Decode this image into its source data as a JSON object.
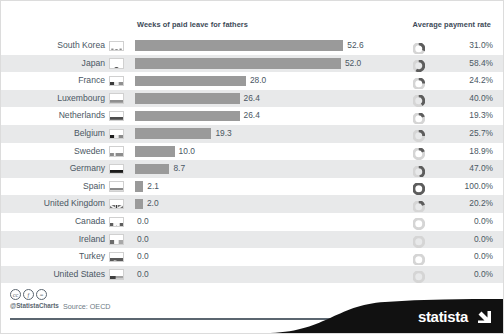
{
  "headers": {
    "left": "Weeks of paid leave for fathers",
    "right": "Average payment rate"
  },
  "footer": {
    "handle": "@StatistaCharts",
    "source": "Source: OECD",
    "brand": "statista",
    "cc_icons": [
      "cc-icon",
      "by-icon",
      "nd-icon"
    ],
    "cc_glyphs": [
      "cc",
      "ƒ",
      "="
    ]
  },
  "colors": {
    "bar": "#9a9a9a",
    "donut_fill": "#5d5d5d",
    "donut_track": "#d5d5d5",
    "row_even": "#e8e9ea",
    "row_odd": "#ffffff",
    "text": "#4a5763",
    "header_text": "#3d4a57",
    "brand_black": "#111111"
  },
  "chart_data": {
    "type": "bar",
    "title": "Weeks of paid leave for fathers",
    "xlabel": "",
    "ylabel": "",
    "xlim": [
      0,
      56
    ],
    "grid": false,
    "legend": "none",
    "categories": [
      "South Korea",
      "Japan",
      "France",
      "Luxembourg",
      "Netherlands",
      "Belgium",
      "Sweden",
      "Germany",
      "Spain",
      "United Kingdom",
      "Canada",
      "Ireland",
      "Turkey",
      "United States"
    ],
    "series": [
      {
        "name": "Weeks of paid leave for fathers",
        "values": [
          52.6,
          52.0,
          28.0,
          26.4,
          26.4,
          19.3,
          10.0,
          8.7,
          2.1,
          2.0,
          0.0,
          0.0,
          0.0,
          0.0
        ],
        "labels": [
          "52.6",
          "52.0",
          "28.0",
          "26.4",
          "26.4",
          "19.3",
          "10.0",
          "8.7",
          "2.1",
          "2.0",
          "0.0",
          "0.0",
          "0.0",
          "0.0"
        ]
      },
      {
        "name": "Average payment rate",
        "values": [
          31.0,
          58.4,
          24.2,
          40.0,
          19.3,
          25.7,
          18.9,
          47.0,
          100.0,
          20.2,
          0.0,
          0.0,
          0.0,
          0.0
        ],
        "labels": [
          "31.0%",
          "58.4%",
          "24.2%",
          "40.0%",
          "19.3%",
          "25.7%",
          "18.9%",
          "47.0%",
          "100.0%",
          "20.2%",
          "0.0%",
          "0.0%",
          "0.0%",
          "0.0%"
        ]
      }
    ]
  },
  "rows": [
    {
      "country": "South Korea",
      "flag": "flag-south-korea",
      "weeks": 52.6,
      "weeks_label": "52.6",
      "rate": 31.0,
      "rate_label": "31.0%"
    },
    {
      "country": "Japan",
      "flag": "flag-japan",
      "weeks": 52.0,
      "weeks_label": "52.0",
      "rate": 58.4,
      "rate_label": "58.4%"
    },
    {
      "country": "France",
      "flag": "flag-france",
      "weeks": 28.0,
      "weeks_label": "28.0",
      "rate": 24.2,
      "rate_label": "24.2%"
    },
    {
      "country": "Luxembourg",
      "flag": "flag-luxembourg",
      "weeks": 26.4,
      "weeks_label": "26.4",
      "rate": 40.0,
      "rate_label": "40.0%"
    },
    {
      "country": "Netherlands",
      "flag": "flag-netherlands",
      "weeks": 26.4,
      "weeks_label": "26.4",
      "rate": 19.3,
      "rate_label": "19.3%"
    },
    {
      "country": "Belgium",
      "flag": "flag-belgium",
      "weeks": 19.3,
      "weeks_label": "19.3",
      "rate": 25.7,
      "rate_label": "25.7%"
    },
    {
      "country": "Sweden",
      "flag": "flag-sweden",
      "weeks": 10.0,
      "weeks_label": "10.0",
      "rate": 18.9,
      "rate_label": "18.9%"
    },
    {
      "country": "Germany",
      "flag": "flag-germany",
      "weeks": 8.7,
      "weeks_label": "8.7",
      "rate": 47.0,
      "rate_label": "47.0%"
    },
    {
      "country": "Spain",
      "flag": "flag-spain",
      "weeks": 2.1,
      "weeks_label": "2.1",
      "rate": 100.0,
      "rate_label": "100.0%"
    },
    {
      "country": "United Kingdom",
      "flag": "flag-united-kingdom",
      "weeks": 2.0,
      "weeks_label": "2.0",
      "rate": 20.2,
      "rate_label": "20.2%"
    },
    {
      "country": "Canada",
      "flag": "flag-canada",
      "weeks": 0.0,
      "weeks_label": "0.0",
      "rate": 0.0,
      "rate_label": "0.0%"
    },
    {
      "country": "Ireland",
      "flag": "flag-ireland",
      "weeks": 0.0,
      "weeks_label": "0.0",
      "rate": 0.0,
      "rate_label": "0.0%"
    },
    {
      "country": "Turkey",
      "flag": "flag-turkey",
      "weeks": 0.0,
      "weeks_label": "0.0",
      "rate": 0.0,
      "rate_label": "0.0%"
    },
    {
      "country": "United States",
      "flag": "flag-united-states",
      "weeks": 0.0,
      "weeks_label": "0.0",
      "rate": 0.0,
      "rate_label": "0.0%"
    }
  ]
}
